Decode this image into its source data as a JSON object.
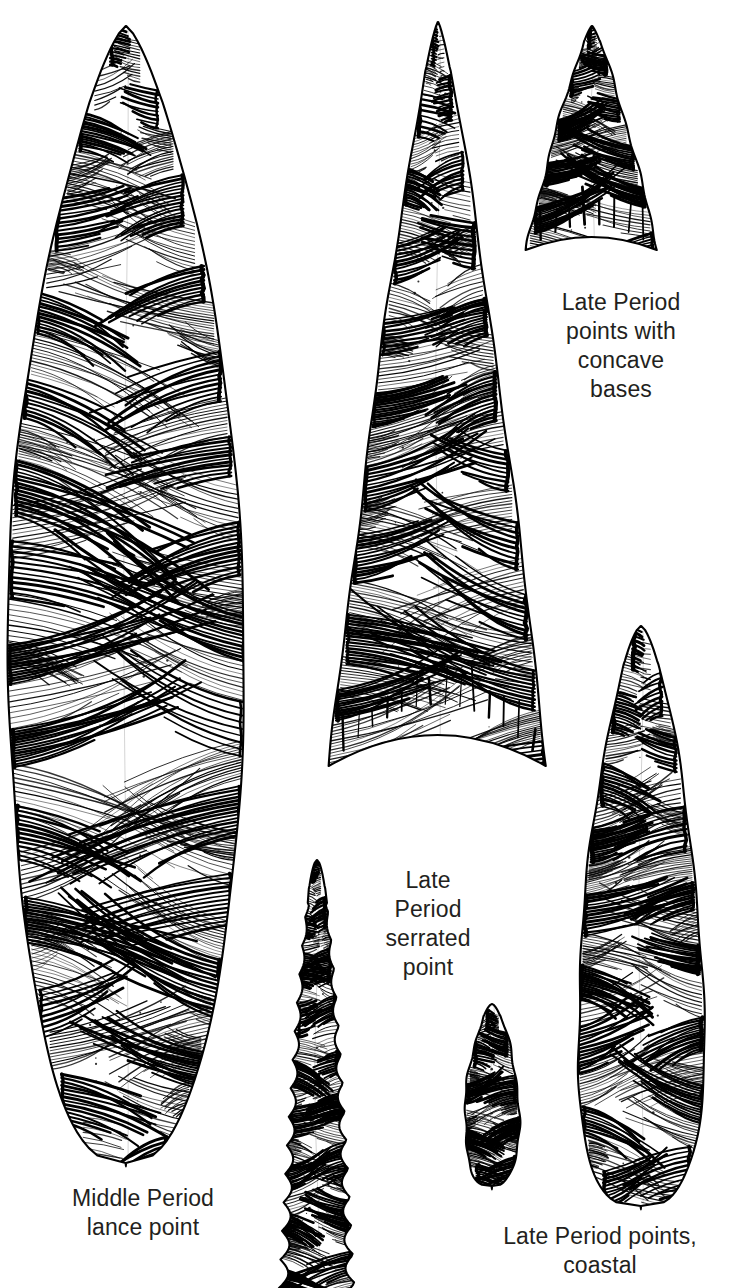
{
  "plate": {
    "kind": "archaeological-illustration",
    "medium": "pen-and-ink line drawing",
    "background_color": "#ffffff",
    "ink_color": "#000000",
    "text_color": "#231f20",
    "width": 745,
    "height": 1288,
    "subject": "Chipped stone projectile points"
  },
  "captions": {
    "concave_bases": "Late Period\npoints with\nconcave\nbases",
    "serrated_point": "Late\nPeriod\nserrated\npoint",
    "lance_point": "Middle Period\nlance point",
    "coastal_points": "Late Period points,\ncoastal"
  },
  "artifacts": [
    {
      "id": "lance-point",
      "label": "Middle Period lance point",
      "shape": "long willow-leaf / lanceolate blade, rounded base",
      "cx": 126,
      "tip_y": 26,
      "base_y": 1163,
      "half_width": 118,
      "widest_y": 640,
      "flake_rows": 26,
      "serrated": false,
      "concave_base": false
    },
    {
      "id": "center-concave-point",
      "label": "Late Period point with concave base (large)",
      "shape": "large triangular blade with deeply concave base",
      "cx": 438,
      "tip_y": 22,
      "base_y": 766,
      "half_width": 109,
      "widest_y": 700,
      "flake_rows": 20,
      "serrated": false,
      "concave_base": true
    },
    {
      "id": "small-concave-point",
      "label": "Late Period point with concave base (small)",
      "shape": "small triangular blade with concave base",
      "cx": 592,
      "tip_y": 26,
      "base_y": 250,
      "half_width": 66,
      "widest_y": 236,
      "flake_rows": 10,
      "serrated": false,
      "concave_base": true
    },
    {
      "id": "serrated-point",
      "label": "Late Period serrated point",
      "shape": "narrow elongate blade with strongly serrated edges",
      "cx": 317,
      "tip_y": 860,
      "base_y": 1288,
      "half_width": 38,
      "widest_y": 1270,
      "flake_rows": 17,
      "serrated": true,
      "concave_base": false
    },
    {
      "id": "coastal-point-small",
      "label": "Late Period point, coastal (small)",
      "shape": "narrow leaf-shaped blade, rounded base",
      "cx": 492,
      "tip_y": 1004,
      "base_y": 1186,
      "half_width": 27,
      "widest_y": 1120,
      "flake_rows": 9,
      "serrated": false,
      "concave_base": false
    },
    {
      "id": "coastal-point-large",
      "label": "Late Period point, coastal (large)",
      "shape": "broad leaf-shaped blade, rounded base",
      "cx": 641,
      "tip_y": 626,
      "base_y": 1206,
      "half_width": 63,
      "widest_y": 1060,
      "flake_rows": 17,
      "serrated": false,
      "concave_base": false
    }
  ]
}
